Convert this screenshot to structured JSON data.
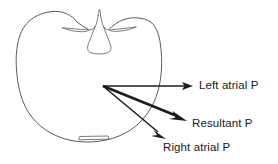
{
  "figure": {
    "background_color": "#ffffff",
    "outline_color": "#4a4a4a",
    "vector_color": "#1c1c1c",
    "text_color": "#1a1a1a"
  },
  "anatomy": {
    "name": "heart-cross-section",
    "notch_name": "interatrial-septum-notch",
    "base_name": "apex-base-marker"
  },
  "vectors": {
    "origin": {
      "x": 103,
      "y": 86
    },
    "items": [
      {
        "id": "left-atrial",
        "label": "Left atrial P",
        "tip": {
          "x": 193,
          "y": 86
        },
        "weight": "thin",
        "direction_deg": 0
      },
      {
        "id": "resultant",
        "label": "Resultant P",
        "tip": {
          "x": 186,
          "y": 121
        },
        "weight": "thick",
        "direction_deg": 21
      },
      {
        "id": "right-atrial",
        "label": "Right atrial P",
        "tip": {
          "x": 165,
          "y": 139
        },
        "weight": "thin",
        "direction_deg": 39
      }
    ]
  },
  "labels": {
    "left_atrial": "Left atrial P",
    "resultant": "Resultant P",
    "right_atrial": "Right atrial P"
  }
}
